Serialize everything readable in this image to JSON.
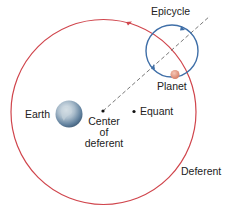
{
  "diagram": {
    "labels": {
      "epicycle": "Epicycle",
      "planet": "Planet",
      "earth": "Earth",
      "center_line1": "Center",
      "center_line2": "of",
      "center_line3": "deferent",
      "equant": "Equant",
      "deferent": "Deferent"
    },
    "colors": {
      "deferent": "#d0454c",
      "epicycle": "#3f6fa8",
      "planet": "#e0907a",
      "dashed_line": "#555555",
      "earth": "#8aa6c4"
    }
  }
}
